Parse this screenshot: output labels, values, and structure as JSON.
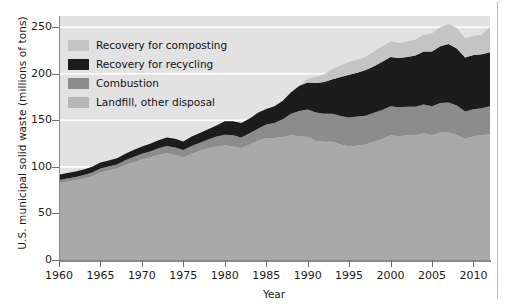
{
  "chart_data": {
    "type": "area",
    "stacked": true,
    "title": "",
    "subtitle": "",
    "xlabel": "Year",
    "ylabel": "U.S. municipal solid waste (millions of tons)",
    "xlim": [
      1960,
      2012
    ],
    "ylim": [
      0,
      262
    ],
    "yticks": [
      0,
      50,
      100,
      150,
      200,
      250
    ],
    "xticks": [
      1960,
      1965,
      1970,
      1975,
      1980,
      1985,
      1990,
      1995,
      2000,
      2005,
      2010
    ],
    "grid": "horizontal-white-gridlines",
    "legend_position": "upper-left-inside",
    "stack_order_bottom_to_top": [
      "Landfill, other disposal",
      "Combustion",
      "Recovery for recycling",
      "Recovery for composting"
    ],
    "x": [
      1960,
      1961,
      1962,
      1963,
      1964,
      1965,
      1966,
      1967,
      1968,
      1969,
      1970,
      1971,
      1972,
      1973,
      1974,
      1975,
      1976,
      1977,
      1978,
      1979,
      1980,
      1981,
      1982,
      1983,
      1984,
      1985,
      1986,
      1987,
      1988,
      1989,
      1990,
      1991,
      1992,
      1993,
      1994,
      1995,
      1996,
      1997,
      1998,
      1999,
      2000,
      2001,
      2002,
      2003,
      2004,
      2005,
      2006,
      2007,
      2008,
      2009,
      2010,
      2011,
      2012
    ],
    "series": [
      {
        "name": "Landfill, other disposal",
        "color": "#a9a9a9",
        "values": [
          82.5,
          84.0,
          85.5,
          87.5,
          90.0,
          94.0,
          96.0,
          98.0,
          102.0,
          105.0,
          108.0,
          110.0,
          113.0,
          115.0,
          113.0,
          110.0,
          114.0,
          117.0,
          120.0,
          122.0,
          123.0,
          122.0,
          120.0,
          124.0,
          128.0,
          131.0,
          131.0,
          132.0,
          134.0,
          133.0,
          132.0,
          128.0,
          127.0,
          127.0,
          124.0,
          122.0,
          123.0,
          124.0,
          127.0,
          130.0,
          134.0,
          133.0,
          134.0,
          134.0,
          136.0,
          134.0,
          137.0,
          137.0,
          134.0,
          130.0,
          133.0,
          134.0,
          135.0
        ]
      },
      {
        "name": "Combustion",
        "color": "#8c8c8c",
        "values": [
          3.5,
          3.6,
          3.7,
          3.8,
          4.0,
          4.2,
          4.3,
          4.5,
          5.0,
          5.5,
          6.0,
          6.5,
          7.0,
          7.5,
          7.8,
          8.0,
          8.5,
          9.0,
          9.5,
          10.5,
          11.5,
          12.0,
          11.5,
          12.0,
          13.0,
          14.5,
          16.0,
          19.0,
          23.0,
          27.0,
          29.5,
          30.5,
          30.0,
          30.0,
          30.5,
          31.0,
          31.0,
          31.0,
          31.0,
          31.0,
          31.0,
          31.0,
          30.5,
          30.5,
          31.0,
          31.0,
          31.5,
          32.0,
          32.0,
          29.5,
          29.0,
          29.0,
          30.0
        ]
      },
      {
        "name": "Recovery for recycling",
        "color": "#1c1c1c",
        "values": [
          5.6,
          5.7,
          5.9,
          6.0,
          6.2,
          6.4,
          6.6,
          6.8,
          7.2,
          7.5,
          8.0,
          8.2,
          8.5,
          9.0,
          9.5,
          9.3,
          10.0,
          10.5,
          11.0,
          12.0,
          14.5,
          15.0,
          15.5,
          16.0,
          17.0,
          16.7,
          18.0,
          20.0,
          23.0,
          27.0,
          29.0,
          31.5,
          34.0,
          37.0,
          42.0,
          46.0,
          47.0,
          49.0,
          50.0,
          52.0,
          53.0,
          53.0,
          53.5,
          55.0,
          57.0,
          59.0,
          61.0,
          63.0,
          61.0,
          58.0,
          58.0,
          58.0,
          58.0
        ]
      },
      {
        "name": "Recovery for composting",
        "color": "#c4c4c4",
        "values": [
          0.0,
          0.0,
          0.0,
          0.0,
          0.0,
          0.0,
          0.0,
          0.0,
          0.0,
          0.0,
          0.0,
          0.0,
          0.0,
          0.0,
          0.0,
          0.0,
          0.0,
          0.0,
          0.0,
          0.0,
          0.0,
          0.0,
          0.0,
          0.0,
          0.0,
          0.0,
          0.0,
          0.0,
          0.0,
          0.5,
          4.2,
          6.5,
          8.5,
          11.0,
          12.5,
          13.5,
          14.0,
          14.5,
          15.5,
          16.5,
          16.5,
          16.0,
          16.5,
          17.0,
          18.0,
          19.5,
          20.5,
          21.5,
          22.0,
          20.5,
          20.5,
          21.0,
          27.5
        ]
      }
    ],
    "annotations": []
  },
  "axes": {
    "ylabel": "U.S. municipal solid waste (millions of tons)",
    "xlabel": "Year",
    "yticks": [
      "0",
      "50",
      "100",
      "150",
      "200",
      "250"
    ],
    "xticks": [
      "1960",
      "1965",
      "1970",
      "1975",
      "1980",
      "1985",
      "1990",
      "1995",
      "2000",
      "2005",
      "2010"
    ]
  },
  "legend": {
    "items": [
      {
        "label": "Recovery for composting",
        "color": "#c4c4c4"
      },
      {
        "label": "Recovery for recycling",
        "color": "#1c1c1c"
      },
      {
        "label": "Combustion",
        "color": "#8c8c8c"
      },
      {
        "label": "Landfill, other disposal",
        "color": "#b6b6b6"
      }
    ]
  },
  "colors": {
    "plot_background": "#e2e2e2",
    "gridline": "#ffffff",
    "axis": "#8a8a8a",
    "text": "#1a1a1a",
    "page_background": "#ffffff"
  }
}
